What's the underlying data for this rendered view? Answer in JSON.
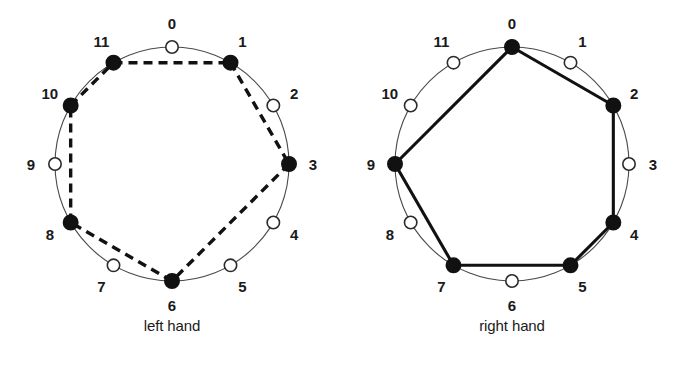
{
  "figure": {
    "type": "pitch-class-clock-diagrams",
    "background_color": "#ffffff",
    "ink_color": "#111111",
    "ring_color": "#4a4a4a"
  },
  "chart_data": {
    "type": "scatter",
    "title": "",
    "subtitle": "",
    "xlabel": "",
    "ylabel": "",
    "grid": false,
    "legend": null,
    "panels": [
      {
        "id": "left-hand",
        "caption": "left hand",
        "center": [
          172,
          164
        ],
        "radius": 117,
        "positions": [
          0,
          1,
          2,
          3,
          4,
          5,
          6,
          7,
          8,
          9,
          10,
          11
        ],
        "labels": [
          "0",
          "1",
          "2",
          "3",
          "4",
          "5",
          "6",
          "7",
          "8",
          "9",
          "10",
          "11"
        ],
        "filled": [
          1,
          3,
          6,
          8,
          10,
          11
        ],
        "open": [
          0,
          2,
          4,
          5,
          7,
          9
        ],
        "polygon": [
          11,
          1,
          3,
          6,
          8,
          10
        ],
        "edges": [
          [
            11,
            1
          ],
          [
            1,
            3
          ],
          [
            3,
            6
          ],
          [
            6,
            8
          ],
          [
            8,
            10
          ],
          [
            10,
            11
          ]
        ],
        "line_style": "dashed"
      },
      {
        "id": "right-hand",
        "caption": "right hand",
        "center": [
          512,
          164
        ],
        "radius": 117,
        "positions": [
          0,
          1,
          2,
          3,
          4,
          5,
          6,
          7,
          8,
          9,
          10,
          11
        ],
        "labels": [
          "0",
          "1",
          "2",
          "3",
          "4",
          "5",
          "6",
          "7",
          "8",
          "9",
          "10",
          "11"
        ],
        "filled": [
          0,
          2,
          4,
          5,
          7,
          9
        ],
        "open": [
          1,
          3,
          6,
          8,
          10,
          11
        ],
        "polygon": [
          0,
          2,
          4,
          5,
          7,
          9
        ],
        "edges": [
          [
            0,
            2
          ],
          [
            2,
            4
          ],
          [
            4,
            5
          ],
          [
            5,
            7
          ],
          [
            7,
            9
          ],
          [
            9,
            0
          ]
        ],
        "line_style": "solid"
      }
    ]
  },
  "captions": {
    "left": "left hand",
    "right": "right hand"
  }
}
